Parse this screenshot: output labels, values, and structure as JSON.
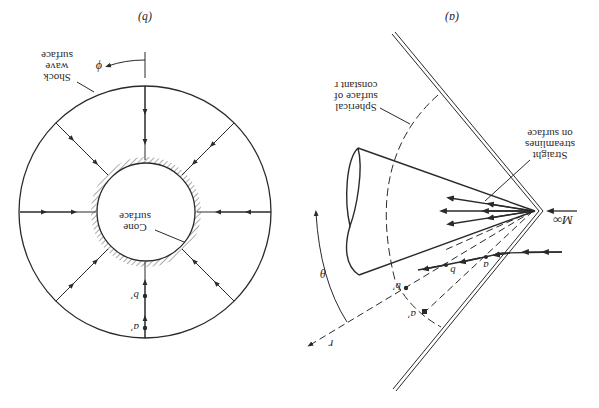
{
  "figure": {
    "orientation": "rotated-180",
    "panels": [
      {
        "id": "a",
        "caption": "(a)",
        "labels": {
          "freestream": "M∞",
          "streamlines": [
            "Straight",
            "streamlines",
            "on surface"
          ],
          "spherical": [
            "Spherical",
            "surface of",
            "constant r"
          ],
          "theta": "θ",
          "r": "r",
          "point_a": "a",
          "point_b": "b",
          "point_a_prime": "a′",
          "point_b_prime": "b′"
        }
      },
      {
        "id": "b",
        "caption": "(b)",
        "labels": {
          "shock": [
            "Shock",
            "wave",
            "surface"
          ],
          "cone": [
            "Cone",
            "surface"
          ],
          "phi": "ϕ",
          "point_a_prime": "a′",
          "point_b_prime": "b′"
        }
      }
    ]
  }
}
